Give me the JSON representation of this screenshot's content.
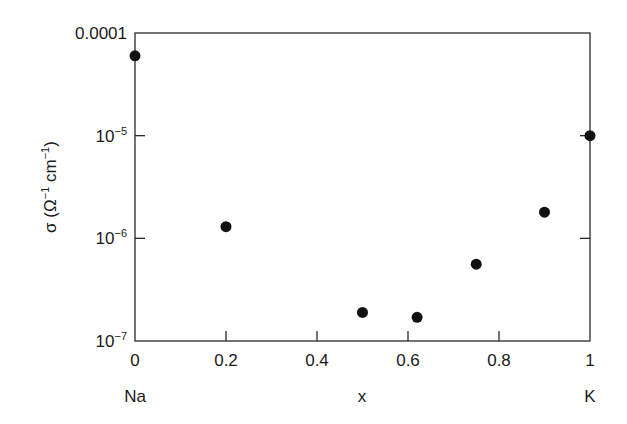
{
  "chart_data": {
    "type": "scatter",
    "title": "",
    "xlabel": "x",
    "ylabel": "σ (Ω⁻¹ cm⁻¹)",
    "ylabel_parts": {
      "sigma": "σ (Ω",
      "exp1": "−1",
      "cm": " cm",
      "exp2": "−1",
      "close": ")"
    },
    "x_end_labels": {
      "left": "Na",
      "right": "K"
    },
    "xlim": [
      0,
      1
    ],
    "ylim": [
      1e-07,
      0.0001
    ],
    "yscale": "log",
    "grid": false,
    "legend": null,
    "x_ticks": [
      "0",
      "0.2",
      "0.4",
      "0.6",
      "0.8",
      "1"
    ],
    "y_ticks": [
      {
        "base": "0.0001",
        "exp": ""
      },
      {
        "base": "10",
        "exp": "−5"
      },
      {
        "base": "10",
        "exp": "−6"
      },
      {
        "base": "10",
        "exp": "−7"
      }
    ],
    "series": [
      {
        "name": "conductivity",
        "x": [
          0,
          0.2,
          0.5,
          0.62,
          0.75,
          0.9,
          1.0
        ],
        "y": [
          6e-05,
          1.3e-06,
          1.9e-07,
          1.7e-07,
          5.6e-07,
          1.8e-06,
          1e-05
        ]
      }
    ]
  }
}
